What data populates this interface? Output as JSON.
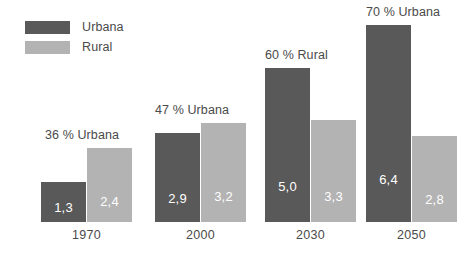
{
  "chart_data": {
    "type": "bar",
    "title": "",
    "subtitle": "",
    "xlabel": "",
    "ylabel": "",
    "grid": false,
    "legend_position": "top-left",
    "ylim": [
      0,
      7.2
    ],
    "categories": [
      "1970",
      "2000",
      "2030",
      "2050"
    ],
    "series": [
      {
        "name": "Urbana",
        "color": "#595959",
        "values": [
          1.3,
          2.9,
          5.0,
          6.4
        ],
        "value_labels": [
          "1,3",
          "2,9",
          "5,0",
          "6,4"
        ]
      },
      {
        "name": "Rural",
        "color": "#b3b3b3",
        "values": [
          2.4,
          3.2,
          3.3,
          2.8
        ],
        "value_labels": [
          "2,4",
          "3,2",
          "3,3",
          "2,8"
        ]
      }
    ],
    "annotations": [
      "36 % Urbana",
      "47 % Urbana",
      "60 % Rural",
      "70 % Urbana"
    ]
  },
  "legend": {
    "items": [
      {
        "label": "Urbana",
        "color": "#595959"
      },
      {
        "label": "Rural",
        "color": "#b3b3b3"
      }
    ]
  },
  "colors": {
    "urbana": "#595959",
    "rural": "#b3b3b3",
    "text": "#4a4a4a",
    "value_text": "#ffffff",
    "background": "#ffffff"
  }
}
